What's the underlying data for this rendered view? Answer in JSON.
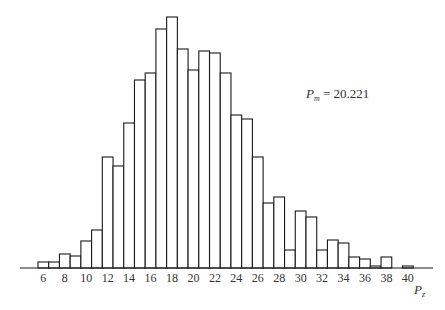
{
  "chart_data": {
    "type": "bar",
    "subtype": "histogram",
    "title": "",
    "xlabel": "P",
    "xlabel_subscript": "z",
    "ylabel": "",
    "x_tick_labels": [
      "6",
      "8",
      "10",
      "12",
      "14",
      "16",
      "18",
      "20",
      "22",
      "24",
      "26",
      "28",
      "30",
      "32",
      "34",
      "36",
      "38",
      "40"
    ],
    "categories": [
      6,
      7,
      8,
      9,
      10,
      11,
      12,
      13,
      14,
      15,
      16,
      17,
      18,
      19,
      20,
      21,
      22,
      23,
      24,
      25,
      26,
      27,
      28,
      29,
      30,
      31,
      32,
      33,
      34,
      35,
      36,
      37,
      38,
      39,
      40
    ],
    "values": [
      6,
      6,
      14,
      12,
      27,
      38,
      111,
      102,
      145,
      188,
      195,
      239,
      251,
      219,
      198,
      217,
      215,
      195,
      153,
      149,
      111,
      65,
      71,
      18,
      57,
      51,
      18,
      28,
      25,
      11,
      9,
      2,
      11,
      0,
      2
    ],
    "value_units": "relative bar height (px, no y-axis shown)",
    "grid": false,
    "legend": null,
    "annotation": {
      "symbol": "P",
      "subscript": "m",
      "equals": "=",
      "value": "20.221"
    }
  },
  "annotation": {
    "symbol": "P",
    "subscript": "m",
    "text": " = 20.221"
  },
  "axis": {
    "xlabel": "P",
    "xlabel_sub": "z"
  }
}
